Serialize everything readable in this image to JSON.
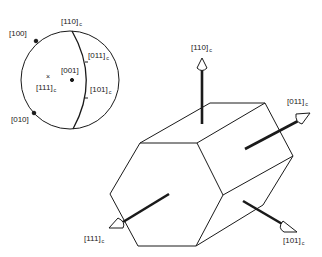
{
  "stereogram": {
    "labels": {
      "p110c": "[110]",
      "p100": "[100]",
      "p011c": "[011]",
      "p001": "[001]",
      "p111c": "[111]",
      "p101c": "[101]",
      "p010": "[010]"
    },
    "subscript": "c",
    "cross_marker": "×"
  },
  "prism": {
    "labels": {
      "a110c": "[110]",
      "a011c": "[011]",
      "a111c": "[111]",
      "a101c": "[101]"
    },
    "subscript": "c"
  },
  "colors": {
    "line": "#1a1a1a",
    "background": "#ffffff"
  }
}
